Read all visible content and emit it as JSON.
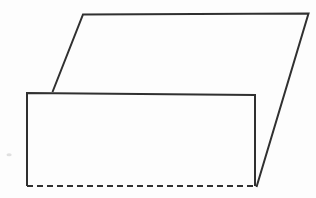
{
  "figure": {
    "type": "geometry-line-drawing",
    "canvas": {
      "width": 316,
      "height": 198,
      "background": "#fdfdfd"
    },
    "stroke": {
      "color": "#303030",
      "width": 2,
      "dash_pattern": "6 4"
    },
    "parallelogram": {
      "outline_path": "M 52.5 92 L 83 14.5 L 308.5 13.5 L 256.5 187",
      "vertices": [
        [
          52.5,
          92
        ],
        [
          83,
          14.5
        ],
        [
          308.5,
          13.5
        ],
        [
          256.5,
          187
        ]
      ]
    },
    "rectangle": {
      "fill": "#fdfdfd",
      "body_path": "M 27 93 L 255 95 L 255 186 L 27 186 Z",
      "solid_edges_path": "M 27 186 L 27 93 L 255 95 L 255 186",
      "hidden_bottom_edge_path": "M 27 186 L 255 186",
      "corners": [
        [
          27,
          93
        ],
        [
          255,
          95
        ],
        [
          255,
          186
        ],
        [
          27,
          186
        ]
      ]
    },
    "scan_artifact": {
      "path": "M 6.5 154.8 a 2.6 1.5 0 1 0 5.2 0 a 2.6 1.5 0 1 0 -5.2 0",
      "color": "#c9c9c9"
    }
  }
}
